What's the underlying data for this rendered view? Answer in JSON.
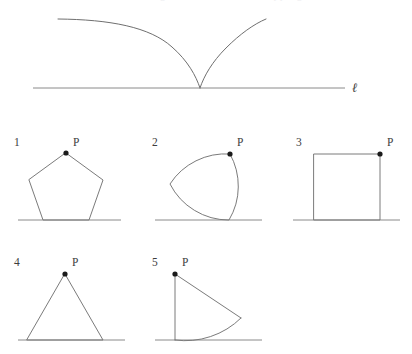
{
  "page": {
    "background_color": "#ffffff",
    "stroke_color": "#6b6b6b",
    "baseline_color": "#7d7d7d",
    "point_color": "#1b1b1b",
    "label_color": "#3d3d3d",
    "width": 412,
    "height": 354,
    "cropped_header_text": "rolls along the line without slipping"
  },
  "top_diagram": {
    "name": "cycloid-above-line",
    "line_label": "ℓ",
    "curve_description": "cycloid arc with cusp touching the line",
    "line": {
      "x1": 33,
      "y1": 88,
      "x2": 345,
      "y2": 88
    },
    "cusp": {
      "x": 200,
      "y": 88
    },
    "left_branch_end": {
      "x": 58,
      "y": 19
    },
    "right_branch_end": {
      "x": 266,
      "y": 19
    }
  },
  "panels": [
    {
      "number": "1",
      "point_label": "P",
      "shape": "pentagon",
      "name": "panel-pentagon",
      "number_pos": {
        "x": 14,
        "y": 146
      },
      "label_pos": {
        "x": 73,
        "y": 146
      },
      "point": {
        "x": 66,
        "y": 153
      },
      "baseline": {
        "x1": 18,
        "y1": 220,
        "x2": 121,
        "y2": 220
      },
      "path": "M 66 153 L 103 180 L 89 220 L 43 220 L 29 180 Z"
    },
    {
      "number": "2",
      "point_label": "P",
      "shape": "reuleaux-triangle",
      "name": "panel-reuleaux-triangle",
      "number_pos": {
        "x": 152,
        "y": 146
      },
      "label_pos": {
        "x": 237,
        "y": 146
      },
      "point": {
        "x": 230,
        "y": 154
      },
      "baseline": {
        "x1": 155,
        "y1": 220,
        "x2": 262,
        "y2": 220
      },
      "path": "M 230 154 A 67 67 0 0 1 229 220 A 67 67 0 0 1 170 184 A 67 67 0 0 1 230 154 Z"
    },
    {
      "number": "3",
      "point_label": "P",
      "shape": "square",
      "name": "panel-square",
      "number_pos": {
        "x": 296,
        "y": 146
      },
      "label_pos": {
        "x": 387,
        "y": 146
      },
      "point": {
        "x": 380,
        "y": 154
      },
      "baseline": {
        "x1": 293,
        "y1": 220,
        "x2": 400,
        "y2": 220
      },
      "path": "M 314 154 L 380 154 L 380 220 L 314 220 Z"
    },
    {
      "number": "4",
      "point_label": "P",
      "shape": "equilateral-triangle",
      "name": "panel-equilateral-triangle",
      "number_pos": {
        "x": 14,
        "y": 266
      },
      "label_pos": {
        "x": 72,
        "y": 266
      },
      "point": {
        "x": 65,
        "y": 274
      },
      "baseline": {
        "x1": 18,
        "y1": 340,
        "x2": 125,
        "y2": 340
      },
      "path": "M 65 274 L 103 340 L 27 340 Z"
    },
    {
      "number": "5",
      "point_label": "P",
      "shape": "circular-sector",
      "name": "panel-circular-sector",
      "number_pos": {
        "x": 152,
        "y": 266
      },
      "label_pos": {
        "x": 182,
        "y": 266
      },
      "point": {
        "x": 175,
        "y": 274
      },
      "baseline": {
        "x1": 155,
        "y1": 340,
        "x2": 262,
        "y2": 340
      },
      "path": "M 175 274 L 175 340 M 175 274 L 241 318 A 66 66 0 0 1 175 340"
    }
  ]
}
